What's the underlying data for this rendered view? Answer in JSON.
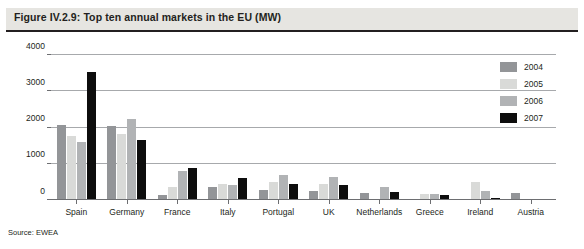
{
  "figure": {
    "title": "Figure IV.2.9: Top ten annual markets in the EU (MW)",
    "source": "Source: EWEA"
  },
  "colors": {
    "series_2004": "#939598",
    "series_2005": "#d9dad8",
    "series_2006": "#b1b3b5",
    "series_2007": "#0d0d0d",
    "title_band": "#e6e5e1",
    "gridline": "#a7a9ac",
    "axis": "#6d6e71",
    "text": "#231f20"
  },
  "chart_data": {
    "type": "bar",
    "title": "Figure IV.2.9: Top ten annual markets in the EU (MW)",
    "xlabel": "",
    "ylabel": "",
    "ylim": [
      0,
      4000
    ],
    "yticks": [
      0,
      1000,
      2000,
      3000,
      4000
    ],
    "ytick_labels": [
      "0",
      "1000",
      "2000",
      "3000",
      "4000"
    ],
    "grid": true,
    "legend_position": "right",
    "categories": [
      "Spain",
      "Germany",
      "France",
      "Italy",
      "Portugal",
      "UK",
      "Netherlands",
      "Greece",
      "Ireland",
      "Austria"
    ],
    "series": [
      {
        "name": "2004",
        "color": "#939598",
        "values": [
          2065,
          2037,
          138,
          357,
          274,
          253,
          197,
          0,
          0,
          192
        ]
      },
      {
        "name": "2005",
        "color": "#d9dad8",
        "values": [
          1764,
          1808,
          367,
          452,
          500,
          447,
          0,
          173,
          496,
          0
        ]
      },
      {
        "name": "2006",
        "color": "#b1b3b5",
        "values": [
          1587,
          2233,
          810,
          417,
          694,
          634,
          356,
          173,
          250,
          0
        ]
      },
      {
        "name": "2007",
        "color": "#0d0d0d",
        "values": [
          3522,
          1667,
          888,
          603,
          434,
          427,
          211,
          125,
          59,
          20
        ]
      }
    ]
  }
}
